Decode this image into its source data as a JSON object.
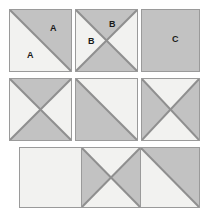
{
  "figure": {
    "background_color": "#ffffff",
    "fill_gray": "#c2c2c2",
    "fill_light": "#f2f2f0",
    "stroke_color": "#8f8f8f",
    "label_color": "#1a1a1a"
  },
  "tiles": [
    {
      "id": "tile-r1c1",
      "row": 1,
      "col": 1,
      "pattern": "diagonal-tl-br",
      "shaded_regions": [
        "upper-right"
      ],
      "labels": [
        {
          "text": "A",
          "region": "upper-right"
        },
        {
          "text": "A",
          "region": "lower-left"
        }
      ]
    },
    {
      "id": "tile-r1c2",
      "row": 1,
      "col": 2,
      "pattern": "x-cross",
      "shaded_regions": [
        "top",
        "bottom"
      ],
      "labels": [
        {
          "text": "B",
          "region": "top"
        },
        {
          "text": "B",
          "region": "left"
        }
      ]
    },
    {
      "id": "tile-r1c3",
      "row": 1,
      "col": 3,
      "pattern": "solid",
      "shaded_regions": [
        "all"
      ],
      "labels": [
        {
          "text": "C",
          "region": "center"
        }
      ]
    },
    {
      "id": "tile-r2c1",
      "row": 2,
      "col": 1,
      "pattern": "x-cross",
      "shaded_regions": [
        "top",
        "bottom"
      ],
      "labels": []
    },
    {
      "id": "tile-r2c2",
      "row": 2,
      "col": 2,
      "pattern": "diagonal-tl-br",
      "shaded_regions": [
        "lower-left"
      ],
      "labels": []
    },
    {
      "id": "tile-r2c3",
      "row": 2,
      "col": 3,
      "pattern": "x-cross",
      "shaded_regions": [
        "left",
        "right"
      ],
      "labels": []
    },
    {
      "id": "tile-r3c1",
      "row": 3,
      "col": 1,
      "pattern": "solid",
      "shaded_regions": [],
      "labels": []
    },
    {
      "id": "tile-r3c2",
      "row": 3,
      "col": 2,
      "pattern": "x-cross",
      "shaded_regions": [
        "left",
        "right"
      ],
      "labels": []
    },
    {
      "id": "tile-r3c3",
      "row": 3,
      "col": 3,
      "pattern": "diagonal-tl-br",
      "shaded_regions": [
        "upper-right"
      ],
      "labels": []
    }
  ],
  "labels_flat": {
    "a1": "A",
    "a2": "A",
    "b1": "B",
    "b2": "B",
    "c1": "C"
  }
}
